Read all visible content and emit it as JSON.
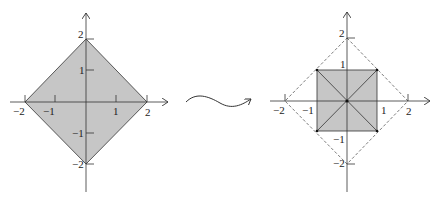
{
  "figure": {
    "header_partial": "(",
    "fill_color": "#c6c6c6",
    "line_color": "#333333",
    "left_plot": {
      "shape": "diamond |x|+|y|<=2 (filled)",
      "x_ticks": [
        "−2",
        "−1",
        "1",
        "2"
      ],
      "y_ticks": [
        "2",
        "1",
        "−1",
        "−2"
      ]
    },
    "transform_arrow": "wavy-arrow",
    "right_plot": {
      "shape": "square max(|x|,|y|)<=1 (filled) inside dashed diamond |x|+|y|<=2, with diagonals",
      "x_ticks": [
        "−2",
        "−1",
        "1",
        "2"
      ],
      "y_ticks": [
        "2",
        "1",
        "−1",
        "−2"
      ]
    }
  }
}
